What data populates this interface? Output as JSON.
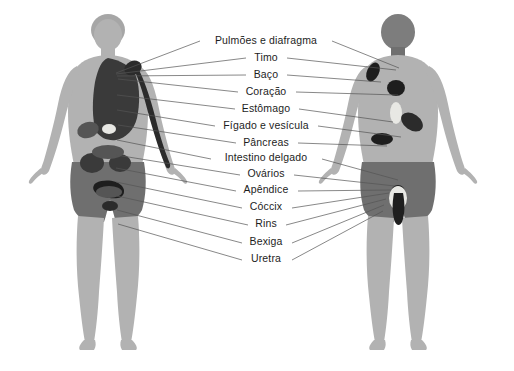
{
  "diagram": {
    "background_color": "#ffffff",
    "body_fill": "#b2b2b2",
    "body_dark_fill": "#6f6f6f",
    "organ_fill": "#3a3a3a",
    "leader_color": "#555555",
    "text_color": "#1d1d1d"
  },
  "labels": [
    {
      "id": "pulmoes-e-diafragma",
      "text": "Pulmões e diafragma",
      "x": 266,
      "y": 44,
      "left": {
        "x1": 200,
        "y1": 41,
        "x2": 116,
        "y2": 73
      },
      "right": {
        "x1": 332,
        "y1": 41,
        "x2": 399,
        "y2": 68
      }
    },
    {
      "id": "timo",
      "text": "Timo",
      "x": 266,
      "y": 61,
      "left": {
        "x1": 246,
        "y1": 58,
        "x2": 116,
        "y2": 74
      },
      "right": {
        "x1": 287,
        "y1": 58,
        "x2": 396,
        "y2": 70
      }
    },
    {
      "id": "baco",
      "text": "Baço",
      "x": 266,
      "y": 78,
      "left": {
        "x1": 246,
        "y1": 75,
        "x2": 117,
        "y2": 76
      },
      "right": {
        "x1": 287,
        "y1": 75,
        "x2": 381,
        "y2": 82
      }
    },
    {
      "id": "coracao",
      "text": "Coração",
      "x": 266,
      "y": 95,
      "left": {
        "x1": 238,
        "y1": 92,
        "x2": 118,
        "y2": 79
      },
      "right": {
        "x1": 296,
        "y1": 92,
        "x2": 398,
        "y2": 95
      }
    },
    {
      "id": "estomago",
      "text": "Estômago",
      "x": 266,
      "y": 112,
      "left": {
        "x1": 235,
        "y1": 109,
        "x2": 117,
        "y2": 95
      },
      "right": {
        "x1": 299,
        "y1": 109,
        "x2": 393,
        "y2": 122
      }
    },
    {
      "id": "figado-e-vesicula",
      "text": "Fígado e vesícula",
      "x": 266,
      "y": 129,
      "left": {
        "x1": 215,
        "y1": 126,
        "x2": 117,
        "y2": 110
      },
      "right": {
        "x1": 318,
        "y1": 126,
        "x2": 401,
        "y2": 137
      }
    },
    {
      "id": "pancreas",
      "text": "Pâncreas",
      "x": 266,
      "y": 146,
      "left": {
        "x1": 236,
        "y1": 143,
        "x2": 118,
        "y2": 125
      },
      "right": {
        "x1": 298,
        "y1": 143,
        "x2": 387,
        "y2": 146
      }
    },
    {
      "id": "intestino-delgado",
      "text": "Intestino delgado",
      "x": 266,
      "y": 161,
      "left": {
        "x1": 211,
        "y1": 159,
        "x2": 117,
        "y2": 140
      },
      "right": {
        "x1": 322,
        "y1": 159,
        "x2": 398,
        "y2": 180
      }
    },
    {
      "id": "ovarios",
      "text": "Ovários",
      "x": 266,
      "y": 177,
      "left": {
        "x1": 240,
        "y1": 175,
        "x2": 116,
        "y2": 155
      },
      "right": {
        "x1": 294,
        "y1": 175,
        "x2": 395,
        "y2": 186
      }
    },
    {
      "id": "apendice",
      "text": "Apêndice",
      "x": 266,
      "y": 193,
      "left": {
        "x1": 236,
        "y1": 191,
        "x2": 116,
        "y2": 168
      },
      "right": {
        "x1": 298,
        "y1": 191,
        "x2": 391,
        "y2": 190
      }
    },
    {
      "id": "coccix",
      "text": "Cóccix",
      "x": 266,
      "y": 210,
      "left": {
        "x1": 242,
        "y1": 208,
        "x2": 116,
        "y2": 182
      },
      "right": {
        "x1": 292,
        "y1": 208,
        "x2": 389,
        "y2": 193
      }
    },
    {
      "id": "rins",
      "text": "Rins",
      "x": 266,
      "y": 227,
      "left": {
        "x1": 248,
        "y1": 225,
        "x2": 117,
        "y2": 196
      },
      "right": {
        "x1": 286,
        "y1": 225,
        "x2": 386,
        "y2": 199
      }
    },
    {
      "id": "bexiga",
      "text": "Bexiga",
      "x": 266,
      "y": 245,
      "left": {
        "x1": 242,
        "y1": 243,
        "x2": 117,
        "y2": 210
      },
      "right": {
        "x1": 292,
        "y1": 243,
        "x2": 384,
        "y2": 205
      }
    },
    {
      "id": "uretra",
      "text": "Uretra",
      "x": 266,
      "y": 262,
      "left": {
        "x1": 242,
        "y1": 260,
        "x2": 118,
        "y2": 224
      },
      "right": {
        "x1": 292,
        "y1": 260,
        "x2": 383,
        "y2": 211
      }
    }
  ],
  "figures": [
    {
      "id": "front-figure",
      "view": "anterior",
      "center_x": 108
    },
    {
      "id": "back-figure",
      "view": "posterior",
      "center_x": 398
    }
  ]
}
